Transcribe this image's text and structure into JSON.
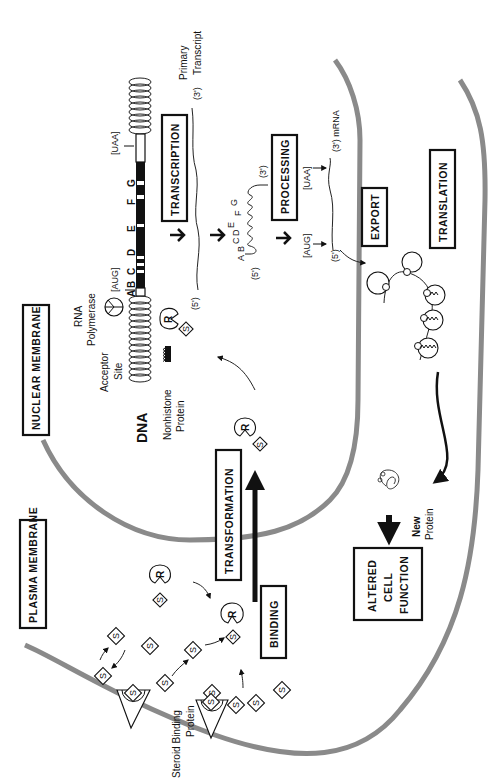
{
  "figure": {
    "orientation": "rotated 90 degrees counter-clockwise"
  },
  "regions": {
    "plasma_membrane": "PLASMA MEMBRANE",
    "nuclear_membrane": "NUCLEAR MEMBRANE"
  },
  "steps": {
    "binding": "BINDING",
    "transformation": "TRANSFORMATION",
    "transcription": "TRANSCRIPTION",
    "processing": "PROCESSING",
    "export": "EXPORT",
    "translation": "TRANSLATION",
    "altered_cell_function": [
      "ALTERED",
      "CELL",
      "FUNCTION"
    ]
  },
  "labels": {
    "steroid_binding_protein": [
      "Steroid Binding",
      "Protein"
    ],
    "dna": "DNA",
    "nonhistone_protein": [
      "Nonhistone",
      "Protein"
    ],
    "acceptor_site": [
      "Acceptor",
      "Site"
    ],
    "rna_polymerase": [
      "RNA",
      "Polymerase"
    ],
    "start_codon": "[AUG]",
    "stop_codon": "[UAA]",
    "primary_transcript": [
      "Primary",
      "Transcript"
    ],
    "three_prime": "(3')",
    "five_prime": "(5')",
    "mrna": "(3') mRNA",
    "new_protein": [
      "New",
      "Protein"
    ],
    "steroid": "S",
    "receptor": "R"
  },
  "gene_segments": [
    "A",
    "B",
    "C",
    "D",
    "E",
    "F",
    "G"
  ],
  "colors": {
    "membrane": "#8a8a8a",
    "ink": "#111111",
    "background": "#ffffff"
  }
}
